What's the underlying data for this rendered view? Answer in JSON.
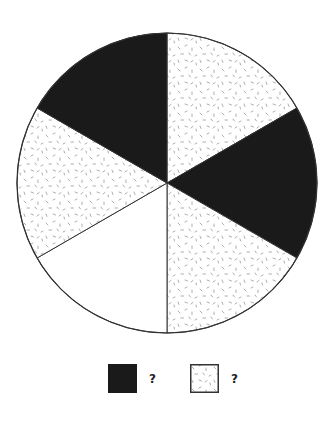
{
  "chart_data": {
    "type": "pie",
    "title": "",
    "slices": [
      {
        "start_deg": -90,
        "end_deg": -30,
        "fill": "dotted",
        "position": "top-right"
      },
      {
        "start_deg": -30,
        "end_deg": 30,
        "fill": "dark",
        "position": "right"
      },
      {
        "start_deg": 30,
        "end_deg": 90,
        "fill": "dotted",
        "position": "bottom-right"
      },
      {
        "start_deg": 90,
        "end_deg": 150,
        "fill": "white",
        "position": "bottom-left"
      },
      {
        "start_deg": 150,
        "end_deg": 210,
        "fill": "dotted",
        "position": "left"
      },
      {
        "start_deg": 210,
        "end_deg": 270,
        "fill": "dark",
        "position": "top-left"
      }
    ],
    "total_slices": 6,
    "counts": {
      "dark": 2,
      "dotted": 3,
      "white": 1
    },
    "legend": [
      {
        "fill": "dark",
        "label": "?"
      },
      {
        "fill": "dotted",
        "label": "?"
      }
    ]
  },
  "colors": {
    "dark": "#1a1a1a",
    "white": "#ffffff",
    "outline": "#333333",
    "dots": "#888888"
  },
  "legend": {
    "dark_label": "?",
    "dotted_label": "?"
  }
}
